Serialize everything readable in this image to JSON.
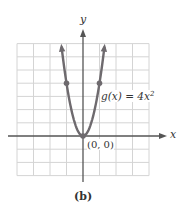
{
  "chart_data": {
    "type": "line",
    "title": "",
    "function": "g(x) = 4x^2",
    "xlabel": "x",
    "ylabel": "y",
    "xlim": [
      -4,
      4
    ],
    "ylim": [
      -3,
      7
    ],
    "grid": true,
    "series": [
      {
        "name": "g(x) = 4x²",
        "x": [
          -1.3,
          -1,
          -0.75,
          -0.5,
          -0.25,
          0,
          0.25,
          0.5,
          0.75,
          1,
          1.3
        ],
        "values": [
          6.76,
          4,
          2.25,
          1,
          0.25,
          0,
          0.25,
          1,
          2.25,
          4,
          6.76
        ],
        "color": "#6e6a6e"
      }
    ],
    "marked_points": [
      {
        "x": -1,
        "y": 4
      },
      {
        "x": 0,
        "y": 0
      },
      {
        "x": 1,
        "y": 4
      }
    ],
    "annotations": [
      {
        "text": "g(x) = 4x²",
        "x": 1.1,
        "y": 3.2
      },
      {
        "text": "(0, 0)",
        "x": 0.2,
        "y": -0.5
      }
    ],
    "caption": "(b)"
  },
  "labels": {
    "x_axis": "x",
    "y_axis": "y",
    "fn_name": "g(x) = 4x",
    "fn_exp": "2",
    "vertex": "(0, 0)",
    "caption": "(b)"
  },
  "colors": {
    "grid": "#d4d4d4",
    "axis": "#555555",
    "curve": "#6e6a6e"
  }
}
